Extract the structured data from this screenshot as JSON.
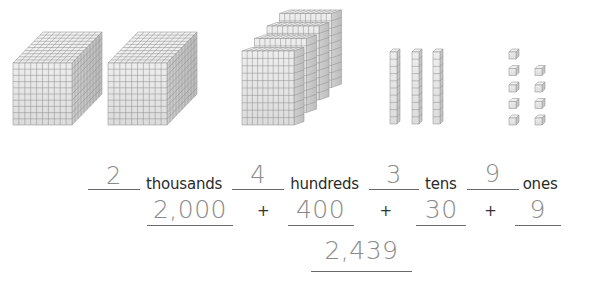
{
  "blocks": {
    "thousands_count": 2,
    "hundreds_count": 4,
    "tens_count": 3,
    "ones_count": 9
  },
  "place_values": [
    {
      "answer": "2",
      "label": "thousands"
    },
    {
      "answer": "4",
      "label": "hundreds"
    },
    {
      "answer": "3",
      "label": "tens"
    },
    {
      "answer": "9",
      "label": "ones"
    }
  ],
  "expanded_form": {
    "terms": [
      "2,000",
      "400",
      "30",
      "9"
    ],
    "operator": "+"
  },
  "standard_form": "2,439",
  "colors": {
    "handwriting": "#8a8a8a",
    "line": "#6a6a6a",
    "text": "#2a2a2a",
    "block_face": "#e6e6e6",
    "block_grid": "#8c8c8c"
  }
}
